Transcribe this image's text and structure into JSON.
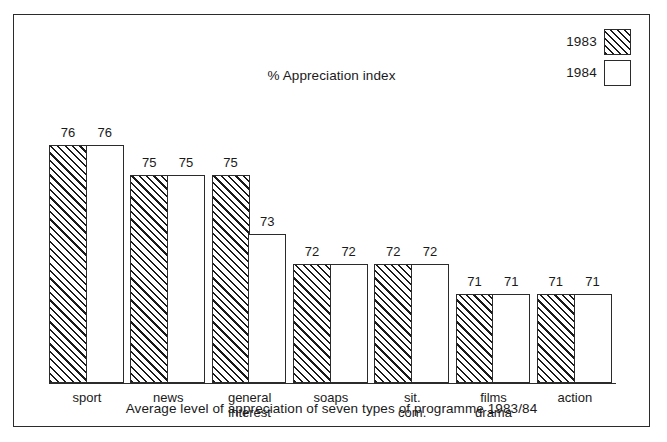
{
  "chart_data": {
    "type": "bar",
    "title": "% Appreciation index",
    "caption": "Average level of appreciation of seven types of programme 1983/84",
    "xlabel": "",
    "ylabel": "% Appreciation index",
    "ylim": [
      68,
      77
    ],
    "grid": false,
    "legend_position": "top-right",
    "categories": [
      "sport",
      "news",
      "general\ninterest",
      "soaps",
      "sit.\ncom.",
      "films\ndrama",
      "action"
    ],
    "series": [
      {
        "name": "1983",
        "fill": "diagonal-hatch",
        "values": [
          76,
          75,
          75,
          72,
          72,
          71,
          71
        ]
      },
      {
        "name": "1984",
        "fill": "white",
        "values": [
          76,
          75,
          73,
          72,
          72,
          71,
          71
        ]
      }
    ]
  },
  "legend": {
    "items": [
      {
        "label": "1983",
        "swatch": "hatched-swatch"
      },
      {
        "label": "1984",
        "swatch": "white-swatch"
      }
    ]
  },
  "colors": {
    "ink": "#1a1a1a",
    "frame": "#2b2b2b",
    "background": "#ffffff"
  }
}
